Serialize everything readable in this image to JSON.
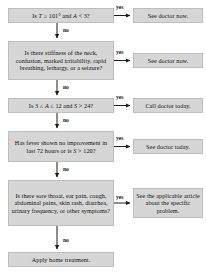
{
  "diagram": {
    "box_fill": "#d6d6d6",
    "box_border": "#bdbdbd",
    "text_color": "#111111",
    "arrow_color": "#1a1a1a"
  },
  "questions": [
    {
      "id": "q1",
      "text": "Is T ≥ 101° and A < 3?"
    },
    {
      "id": "q2",
      "text": "Is there stiffness of the neck, confusion, marked irritability, rapid breathing, lethargy, or a seizure?"
    },
    {
      "id": "q3",
      "text": "Is 3 ≤ A ≤ 12 and S > 24?"
    },
    {
      "id": "q4",
      "text": "Has fever shown no improvement in last 72 hours or is S > 120?"
    },
    {
      "id": "q5",
      "text": "Is there sore throat, ear pain, cough, abdominal pains, skin rash, diarrhea, urinary frequency, or other symptoms?"
    },
    {
      "id": "q6",
      "text": "Apply home treatment."
    }
  ],
  "outcomes": [
    {
      "id": "o1",
      "text": "See doctor now."
    },
    {
      "id": "o2",
      "text": "See doctor now."
    },
    {
      "id": "o3",
      "text": "Call doctor today."
    },
    {
      "id": "o4",
      "text": "See doctor today."
    },
    {
      "id": "o5",
      "text": "See the applicable article about the specific problem."
    }
  ],
  "edge_labels": {
    "yes1": "yes",
    "yes2": "yes",
    "yes3": "yes",
    "yes4": "yes",
    "yes5": "yes",
    "no1": "no",
    "no2": "no",
    "no3": "no",
    "no4": "no",
    "no5": "no"
  }
}
